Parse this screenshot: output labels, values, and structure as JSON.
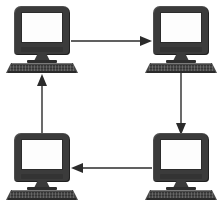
{
  "diagram": {
    "background_color": "#ffffff",
    "node_color": "#3b3b3b",
    "screen_color": "#fdfdfd",
    "arrow_color": "#2b2b2b",
    "topology": "ring",
    "direction": "clockwise",
    "node_count": 4,
    "nodes": [
      {
        "id": "computer-top-left",
        "label": "Computer",
        "position": "top-left",
        "x": 6,
        "y": 6
      },
      {
        "id": "computer-top-right",
        "label": "Computer",
        "position": "top-right",
        "x": 145,
        "y": 6
      },
      {
        "id": "computer-bottom-left",
        "label": "Computer",
        "position": "bottom-left",
        "x": 6,
        "y": 133
      },
      {
        "id": "computer-bottom-right",
        "label": "Computer",
        "position": "bottom-right",
        "x": 145,
        "y": 133
      }
    ],
    "connections": [
      {
        "id": "link-top",
        "from": "computer-top-left",
        "to": "computer-top-right",
        "direction": "right",
        "orientation": "horizontal"
      },
      {
        "id": "link-right",
        "from": "computer-top-right",
        "to": "computer-bottom-right",
        "direction": "down",
        "orientation": "vertical"
      },
      {
        "id": "link-bottom",
        "from": "computer-bottom-right",
        "to": "computer-bottom-left",
        "direction": "left",
        "orientation": "horizontal"
      },
      {
        "id": "link-left",
        "from": "computer-bottom-left",
        "to": "computer-top-left",
        "direction": "up",
        "orientation": "vertical"
      }
    ]
  }
}
